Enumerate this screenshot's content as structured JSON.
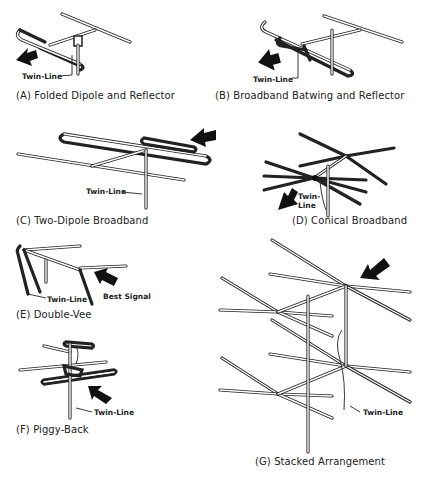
{
  "figure": {
    "panels": [
      {
        "id": "A",
        "caption": "(A) Folded Dipole and Reflector",
        "labels": [
          "Twin-Line"
        ]
      },
      {
        "id": "B",
        "caption": "(B) Broadband Batwing and Reflector",
        "labels": [
          "Twin-Line"
        ]
      },
      {
        "id": "C",
        "caption": "(C) Two-Dipole Broadband",
        "labels": [
          "Twin-Line"
        ]
      },
      {
        "id": "D",
        "caption": "(D) Conical Broadband",
        "labels": [
          "Twin-",
          "Line"
        ]
      },
      {
        "id": "E",
        "caption": "(E) Double-Vee",
        "labels": [
          "Twin-Line",
          "Best Signal"
        ]
      },
      {
        "id": "F",
        "caption": "(F) Piggy-Back",
        "labels": [
          "Twin-Line"
        ]
      },
      {
        "id": "G",
        "caption": "(G) Stacked Arrangement",
        "labels": [
          "Twin-Line"
        ]
      }
    ],
    "arrow_meaning": "direction of best signal",
    "colors": {
      "line": "#222222",
      "background": "#ffffff"
    }
  }
}
